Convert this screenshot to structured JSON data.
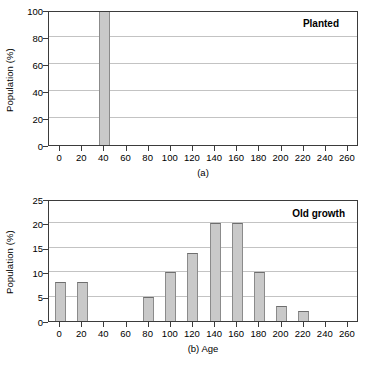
{
  "figure": {
    "panels": [
      {
        "id": "a",
        "caption": "(a)",
        "series_label": "Planted",
        "ylabel": "Population (%)",
        "xlabel": ""
      },
      {
        "id": "b",
        "caption": "(b) Age",
        "series_label": "Old growth",
        "ylabel": "Population (%)",
        "xlabel": "Age"
      }
    ]
  },
  "chart_data": [
    {
      "type": "bar",
      "title": "Planted",
      "xlabel": "Age",
      "ylabel": "Population (%)",
      "xlim": [
        -10,
        270
      ],
      "ylim": [
        0,
        100
      ],
      "xticks": [
        0,
        20,
        40,
        60,
        80,
        100,
        120,
        140,
        160,
        180,
        200,
        220,
        240,
        260
      ],
      "yticks": [
        0,
        20,
        40,
        60,
        80,
        100
      ],
      "xtick_labels": [
        "0",
        "20",
        "40",
        "60",
        "80",
        "100",
        "120",
        "140",
        "160",
        "180",
        "200",
        "220",
        "240",
        "260"
      ],
      "ytick_labels": [
        "0",
        "20",
        "40",
        "60",
        "80",
        "100"
      ],
      "grid": "horizontal",
      "legend_position": "top-right-inside",
      "bar_width": 10,
      "categories": [
        0,
        20,
        40,
        60,
        80,
        100,
        120,
        140,
        160,
        180,
        200,
        220,
        240,
        260
      ],
      "values": [
        0,
        0,
        100,
        0,
        0,
        0,
        0,
        0,
        0,
        0,
        0,
        0,
        0,
        0
      ],
      "annotations": [
        "Planted",
        "(a)"
      ],
      "colors": {
        "bar_fill": "#c9c9c9",
        "bar_edge": "#8b8b8b",
        "axis": "#3b3b3b",
        "grid": "#c3c3c3"
      }
    },
    {
      "type": "bar",
      "title": "Old growth",
      "xlabel": "Age",
      "ylabel": "Population (%)",
      "xlim": [
        -10,
        270
      ],
      "ylim": [
        0,
        25
      ],
      "xticks": [
        0,
        20,
        40,
        60,
        80,
        100,
        120,
        140,
        160,
        180,
        200,
        220,
        240,
        260
      ],
      "yticks": [
        0,
        5,
        10,
        15,
        20,
        25
      ],
      "xtick_labels": [
        "0",
        "20",
        "40",
        "60",
        "80",
        "100",
        "120",
        "140",
        "160",
        "180",
        "200",
        "220",
        "240",
        "260"
      ],
      "ytick_labels": [
        "0",
        "5",
        "10",
        "15",
        "20",
        "25"
      ],
      "grid": "horizontal",
      "legend_position": "top-right-inside",
      "bar_width": 10,
      "categories": [
        0,
        20,
        40,
        60,
        80,
        100,
        120,
        140,
        160,
        180,
        200,
        220,
        240,
        260
      ],
      "values": [
        8,
        8,
        0,
        0,
        5,
        10,
        14,
        20,
        20,
        10,
        3,
        2,
        0,
        0
      ],
      "annotations": [
        "Old growth",
        "(b) Age"
      ],
      "colors": {
        "bar_fill": "#c9c9c9",
        "bar_edge": "#8b8b8b",
        "axis": "#3b3b3b",
        "grid": "#c3c3c3"
      }
    }
  ]
}
